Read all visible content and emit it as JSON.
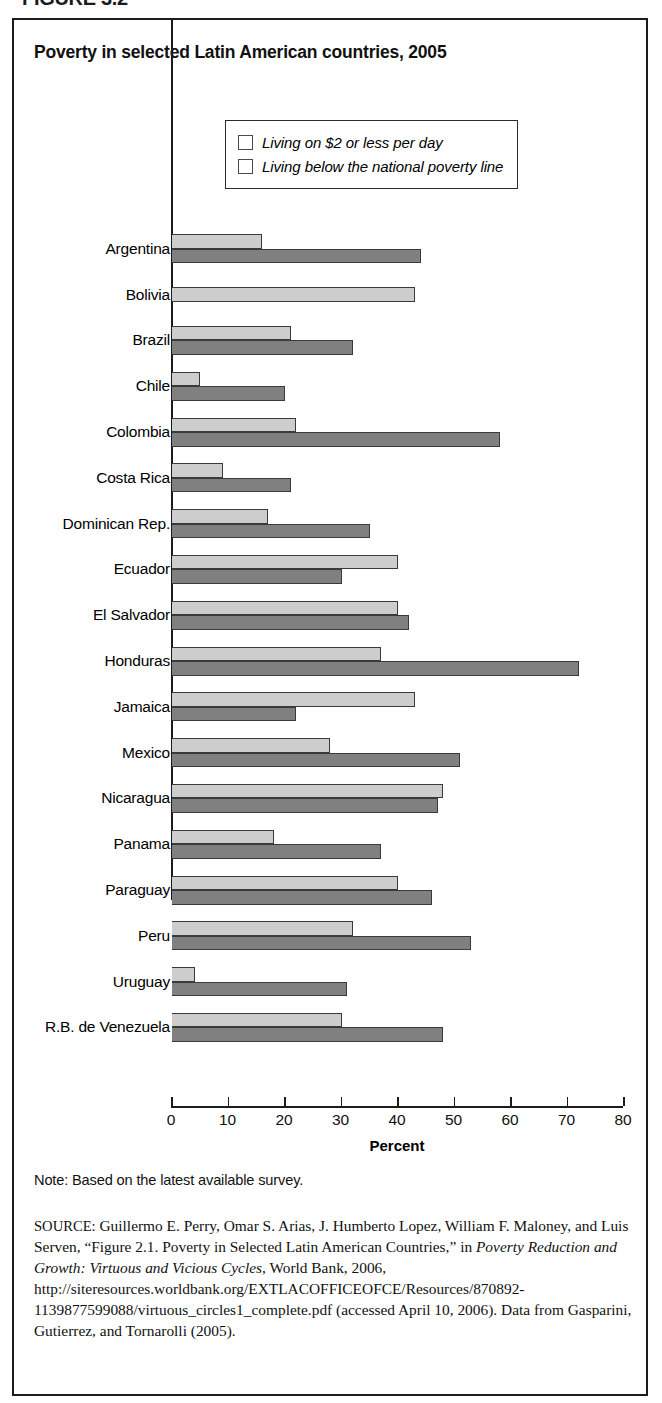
{
  "figure_caption": "FIGURE 3.2",
  "chart_title": "Poverty in selected Latin American countries, 2005",
  "legend": {
    "items": [
      {
        "label": "Living on $2 or less per day",
        "color": "#cdcdcd",
        "swatch_icon": "legend-swatch-light"
      },
      {
        "label": "Living below the national poverty line",
        "color": "#808080",
        "swatch_icon": "legend-swatch-dark"
      }
    ]
  },
  "x_axis": {
    "title": "Percent",
    "ticks": [
      "0",
      "10",
      "20",
      "30",
      "40",
      "50",
      "60",
      "70",
      "80"
    ]
  },
  "note": "Note: Based on the latest available survey.",
  "source": {
    "keyword": "SOURCE:",
    "text_1": " Guillermo E. Perry, Omar S. Arias, J. Humberto Lopez, William F. Maloney, and Luis Serven, “Figure 2.1. Poverty in Selected Latin American Countries,” in ",
    "italic_1": "Poverty Reduction and Growth: Virtuous and Vicious Cycles",
    "text_2": ", World Bank, 2006, http://siteresources.worldbank.org/EXTLACOFFICEOFCE/Resources/870892-1139877599088/virtuous_circles1_complete.pdf (accessed April 10, 2006). Data from Gasparini, Gutierrez, and Tornarolli (2005)."
  },
  "chart_data": {
    "type": "bar",
    "orientation": "horizontal",
    "title": "Poverty in selected Latin American countries, 2005",
    "xlabel": "Percent",
    "ylabel": "",
    "xlim": [
      0,
      80
    ],
    "xticks": [
      0,
      10,
      20,
      30,
      40,
      50,
      60,
      70,
      80
    ],
    "grid": false,
    "legend_position": "top-center",
    "categories": [
      "Argentina",
      "Bolivia",
      "Brazil",
      "Chile",
      "Colombia",
      "Costa Rica",
      "Dominican Rep.",
      "Ecuador",
      "El Salvador",
      "Honduras",
      "Jamaica",
      "Mexico",
      "Nicaragua",
      "Panama",
      "Paraguay",
      "Peru",
      "Uruguay",
      "R.B. de Venezuela"
    ],
    "series": [
      {
        "name": "Living on $2 or less per day",
        "color": "#cdcdcd",
        "values": [
          16,
          43,
          21,
          5,
          22,
          9,
          17,
          40,
          40,
          37,
          43,
          28,
          48,
          18,
          40,
          32,
          4,
          30
        ]
      },
      {
        "name": "Living below the national poverty line",
        "color": "#808080",
        "values": [
          44,
          null,
          32,
          20,
          58,
          21,
          35,
          30,
          42,
          72,
          22,
          51,
          47,
          37,
          46,
          53,
          31,
          48
        ]
      }
    ]
  }
}
